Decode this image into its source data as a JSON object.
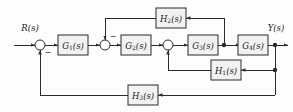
{
  "diagram": {
    "type": "control-system-block-diagram",
    "background_color": "#fdfdfd",
    "line_color": "#2b2b2b",
    "block_fill_color": "#f2f2f2",
    "io": {
      "input_label": "R(s)",
      "output_label": "Y(s)"
    },
    "forward_blocks": [
      {
        "id": "G1",
        "base": "G",
        "subscript": "1",
        "arg": "(s)",
        "label": "G1(s)"
      },
      {
        "id": "G2",
        "base": "G",
        "subscript": "2",
        "arg": "(s)",
        "label": "G2(s)"
      },
      {
        "id": "G3",
        "base": "G",
        "subscript": "3",
        "arg": "(s)",
        "label": "G3(s)"
      },
      {
        "id": "G4",
        "base": "G",
        "subscript": "4",
        "arg": "(s)",
        "label": "G4(s)"
      }
    ],
    "feedback_blocks": [
      {
        "id": "H2",
        "base": "H",
        "subscript": "2",
        "arg": "(s)",
        "label": "H2(s)",
        "path": "inner-top"
      },
      {
        "id": "H1",
        "base": "H",
        "subscript": "1",
        "arg": "(s)",
        "label": "H1(s)",
        "path": "inner-middle"
      },
      {
        "id": "H3",
        "base": "H",
        "subscript": "3",
        "arg": "(s)",
        "label": "H3(s)",
        "path": "outer-bottom"
      }
    ],
    "summing_junctions": [
      {
        "id": "sum1",
        "sign_label": "−",
        "sign_position": "bottom-right"
      },
      {
        "id": "sum2",
        "sign_label": "−",
        "sign_position": "top-right"
      },
      {
        "id": "sum3",
        "sign_label": "",
        "sign_position": "none"
      }
    ],
    "takeoff_nodes": [
      {
        "id": "nodeA",
        "after": "G3"
      },
      {
        "id": "nodeB",
        "after": "G4"
      },
      {
        "id": "nodeC",
        "on": "output-vertical"
      }
    ]
  }
}
